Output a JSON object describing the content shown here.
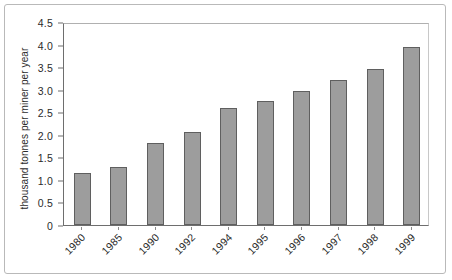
{
  "figure": {
    "frame_color": "#b9b9b9",
    "background": "#ffffff"
  },
  "chart_data": {
    "type": "bar",
    "title": "",
    "subtitle": "",
    "xlabel": "",
    "ylabel": "thousand tonnes per miner per year",
    "categories": [
      "1980",
      "1985",
      "1990",
      "1992",
      "1994",
      "1995",
      "1996",
      "1997",
      "1998",
      "1999"
    ],
    "values": [
      1.15,
      1.28,
      1.82,
      2.07,
      2.59,
      2.76,
      2.96,
      3.21,
      3.45,
      3.95
    ],
    "ylim": [
      0,
      4.5
    ],
    "ytick_labels": [
      "0",
      "0.5",
      "1.0",
      "1.5",
      "2.0",
      "2.5",
      "3.0",
      "3.5",
      "4.0",
      "4.5"
    ],
    "ytick_values": [
      0,
      0.5,
      1.0,
      1.5,
      2.0,
      2.5,
      3.0,
      3.5,
      4.0,
      4.5
    ],
    "grid": false,
    "legend": null,
    "legend_position": "none",
    "bar_fill_color": "#9d9d9d",
    "bar_border_color": "#5f5f5f",
    "axis_color": "#6e6e6e",
    "xtick_label_rotation": -45
  }
}
